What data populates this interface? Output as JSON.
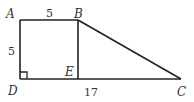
{
  "diagram": {
    "type": "geometry-figure",
    "points": {
      "A": {
        "label": "A",
        "x": 20,
        "y": 20
      },
      "B": {
        "label": "B",
        "x": 78,
        "y": 20
      },
      "C": {
        "label": "C",
        "x": 181,
        "y": 79
      },
      "D": {
        "label": "D",
        "x": 20,
        "y": 79
      },
      "E": {
        "label": "E",
        "x": 78,
        "y": 79
      }
    },
    "segments": [
      "AB",
      "AD",
      "BE",
      "BC",
      "DC"
    ],
    "right_angle_at": "D",
    "measurements": {
      "AB": "5",
      "AD": "5",
      "DC": "17"
    },
    "colors": {
      "stroke": "#222222",
      "text": "#333333"
    }
  }
}
